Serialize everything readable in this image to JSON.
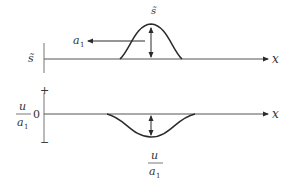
{
  "diagram": {
    "top_panel": {
      "axis_label": "x",
      "y_label": "s̃",
      "peak_label": "s̃",
      "arrow_label": "a",
      "arrow_label_sub": "1"
    },
    "bottom_panel": {
      "axis_label": "x",
      "y_label_num": "u",
      "y_label_den": "a",
      "y_label_den_sub": "1",
      "zero_label": "0",
      "plus_label": "+",
      "minus_label": "−",
      "dip_label_num": "u",
      "dip_label_den": "a",
      "dip_label_den_sub": "1"
    },
    "colors": {
      "line": "#2a2a2a",
      "axis": "#555555",
      "text": "#333333"
    }
  }
}
